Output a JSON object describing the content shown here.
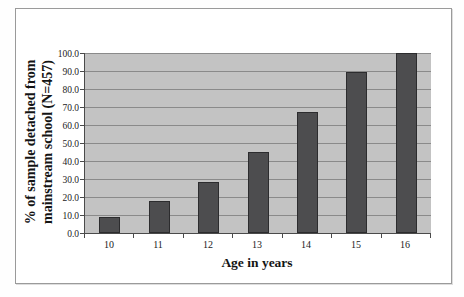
{
  "figure": {
    "background": "#ffffff",
    "border_color": "#9a9a9a"
  },
  "chart_data": {
    "type": "bar",
    "categories": [
      "10",
      "11",
      "12",
      "13",
      "14",
      "15",
      "16"
    ],
    "values": [
      9,
      18,
      28.5,
      45,
      67,
      89.5,
      100
    ],
    "title": "",
    "xlabel": "Age in years",
    "ylabel": "% of sample detached from mainstream school (N=457)",
    "ylabel_lines": [
      "% of sample detached from",
      "mainstream school (N=457)"
    ],
    "ylim": [
      0,
      100
    ],
    "ytick_step": 10,
    "ytick_labels": [
      "0.0",
      "10.0",
      "20.0",
      "30.0",
      "40.0",
      "50.0",
      "60.0",
      "70.0",
      "80.0",
      "90.0",
      "100.0"
    ],
    "grid": true,
    "legend": "none",
    "colors": {
      "bar_fill": "#4d4d4f",
      "bar_border": "#2c2c2e",
      "plot_background": "#c3c3c3",
      "gridline": "#8a8a8a",
      "axis_line": "#4a4a4a",
      "text": "#1b1b1b"
    }
  }
}
